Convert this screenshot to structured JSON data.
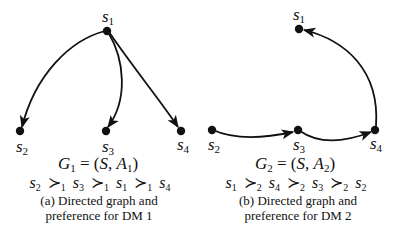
{
  "panels": [
    {
      "id": "a",
      "nodes": [
        {
          "name": "s",
          "sub": "1"
        },
        {
          "name": "s",
          "sub": "2"
        },
        {
          "name": "s",
          "sub": "3"
        },
        {
          "name": "s",
          "sub": "4"
        }
      ],
      "edges": [
        [
          "s1",
          "s2"
        ],
        [
          "s1",
          "s3"
        ],
        [
          "s1",
          "s4"
        ]
      ],
      "graph": {
        "G": "G",
        "Gsub": "1",
        "eq": " = (",
        "S": "S",
        "comma": ", ",
        "A": "A",
        "Asub": "1",
        "close": ")"
      },
      "preference": {
        "order": [
          "2",
          "3",
          "1",
          "4"
        ],
        "op": "≻",
        "op_sub": "1"
      },
      "caption": {
        "line1": "(a) Directed graph and",
        "line2": "preference for DM 1"
      }
    },
    {
      "id": "b",
      "nodes": [
        {
          "name": "s",
          "sub": "1"
        },
        {
          "name": "s",
          "sub": "2"
        },
        {
          "name": "s",
          "sub": "3"
        },
        {
          "name": "s",
          "sub": "4"
        }
      ],
      "edges": [
        [
          "s2",
          "s3"
        ],
        [
          "s3",
          "s4"
        ],
        [
          "s4",
          "s1"
        ]
      ],
      "graph": {
        "G": "G",
        "Gsub": "2",
        "eq": " = (",
        "S": "S",
        "comma": ", ",
        "A": "A",
        "Asub": "2",
        "close": ")"
      },
      "preference": {
        "order": [
          "1",
          "4",
          "3",
          "2"
        ],
        "op": "≻",
        "op_sub": "2"
      },
      "caption": {
        "line1": "(b) Directed graph and",
        "line2": "preference for DM 2"
      }
    }
  ],
  "colors": {
    "stroke": "#111111",
    "background": "#ffffff"
  }
}
